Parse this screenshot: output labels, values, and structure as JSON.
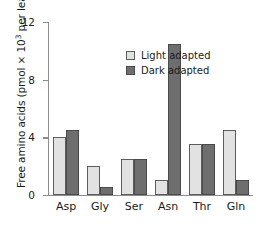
{
  "chart_data": {
    "type": "bar",
    "title": "",
    "subtitle": "",
    "xlabel": "",
    "ylabel": "Free amino acids (pmol × 10³ per leaf)",
    "ylabel_parts": {
      "before": "Free amino acids (pmol × 10",
      "exponent": "3",
      "after": " per leaf)"
    },
    "categories": [
      "Asp",
      "Gly",
      "Ser",
      "Asn",
      "Thr",
      "Gln"
    ],
    "series": [
      {
        "name": "Light adapted",
        "color": "#e2e2e2",
        "edge_color": "#5d5d5d",
        "values": [
          4.0,
          2.0,
          2.5,
          1.0,
          3.5,
          4.5
        ]
      },
      {
        "name": "Dark adapted",
        "color": "#6e6e6e",
        "edge_color": "#4a4a4a",
        "values": [
          4.5,
          0.5,
          2.5,
          10.5,
          3.5,
          1.0
        ]
      }
    ],
    "ylim": [
      0,
      12
    ],
    "yticks": [
      0,
      4,
      8,
      12
    ],
    "ytick_labels": [
      "0",
      "4",
      "8",
      "12"
    ],
    "grid": false,
    "legend_position": "upper-left-inside",
    "axis_color": "#8d8d8d",
    "text_color": "#1a1a1a"
  }
}
